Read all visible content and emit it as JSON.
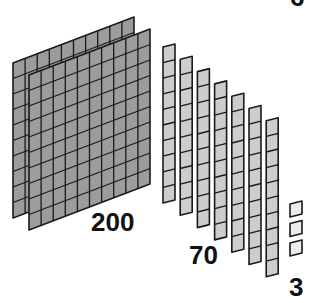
{
  "diagram": {
    "colors": {
      "flat_fill": "#9c9c9c",
      "rod_fill": "#cdcdcd",
      "unit_fill": "#ececec",
      "stroke": "#1a1a1a",
      "background": "#ffffff"
    },
    "groups": [
      {
        "name": "hundreds",
        "block_type": "flat",
        "count": 2,
        "grid": "10x10",
        "label": "200"
      },
      {
        "name": "tens",
        "block_type": "rod",
        "count": 7,
        "cells_per_block": 10,
        "label": "70"
      },
      {
        "name": "ones",
        "block_type": "unit",
        "count": 3,
        "label": "3"
      }
    ],
    "clipped_top_label": "6"
  }
}
